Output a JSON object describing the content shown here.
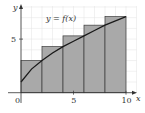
{
  "chart_data": {
    "type": "bar",
    "subtype": "riemann-sum-right-endpoints-with-curve",
    "title": "",
    "curve_label": "y = f(x)",
    "xlabel": "x",
    "ylabel": "y",
    "xlim": [
      0,
      10
    ],
    "ylim": [
      0,
      7.5
    ],
    "x_ticks": [
      {
        "value": 0,
        "label": "0"
      },
      {
        "value": 5,
        "label": "5"
      },
      {
        "value": 10,
        "label": "10"
      }
    ],
    "y_ticks": [
      {
        "value": 5,
        "label": "5"
      }
    ],
    "grid": true,
    "bars": [
      {
        "x_start": 0,
        "x_end": 2,
        "height": 3.0
      },
      {
        "x_start": 2,
        "x_end": 4,
        "height": 4.3
      },
      {
        "x_start": 4,
        "x_end": 6,
        "height": 5.3
      },
      {
        "x_start": 6,
        "x_end": 8,
        "height": 6.3
      },
      {
        "x_start": 8,
        "x_end": 10,
        "height": 7.1
      }
    ],
    "curve_points": [
      {
        "x": 0,
        "y": 1.0
      },
      {
        "x": 1,
        "y": 2.2
      },
      {
        "x": 2,
        "y": 3.0
      },
      {
        "x": 3,
        "y": 3.7
      },
      {
        "x": 4,
        "y": 4.3
      },
      {
        "x": 5,
        "y": 4.8
      },
      {
        "x": 6,
        "y": 5.3
      },
      {
        "x": 7,
        "y": 5.8
      },
      {
        "x": 8,
        "y": 6.3
      },
      {
        "x": 9,
        "y": 6.7
      },
      {
        "x": 10,
        "y": 7.1
      }
    ]
  },
  "colors": {
    "bar_fill": "#a9a9a9",
    "bar_stroke": "#3a3a3a",
    "curve": "#1a1a1a",
    "grid": "#e2e2e2",
    "axis": "#333333"
  }
}
